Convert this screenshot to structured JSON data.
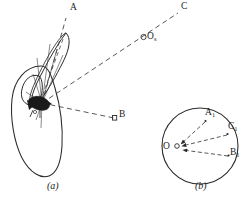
{
  "figure": {
    "background_color": "#ffffff",
    "stroke_color": "#2b2b2b",
    "fill_dark_color": "#1a1a1a",
    "panels": [
      {
        "id": "a",
        "label": "(a)",
        "description": "teardrop outline with elongated leaf ellipse and dashed rays converging at dark cluster",
        "label_x": 47,
        "label_y": 186
      },
      {
        "id": "b",
        "label": "(b)",
        "description": "circle with center O and inward arrows from boundary points",
        "label_x": 195,
        "label_y": 186
      }
    ]
  },
  "panel_a": {
    "points": [
      {
        "name": "A",
        "text": "A",
        "sub": "",
        "x": 70,
        "y": 7
      },
      {
        "name": "B",
        "text": "B",
        "sub": "",
        "x": 118,
        "y": 112
      },
      {
        "name": "C",
        "text": "C",
        "sub": "",
        "x": 181,
        "y": 3
      },
      {
        "name": "O_s",
        "text": "O",
        "sub": "s",
        "x": 141,
        "y": 31
      }
    ],
    "origin": {
      "x": 42,
      "y": 103
    },
    "ray_targets": [
      {
        "to": "A",
        "x": 66,
        "y": 18
      },
      {
        "to": "B",
        "x": 115,
        "y": 118
      },
      {
        "to": "C",
        "x": 178,
        "y": 14
      }
    ]
  },
  "panel_b": {
    "center": {
      "label": "O",
      "x": 166,
      "y": 148,
      "cx": 177,
      "cy": 146,
      "r": 2.3
    },
    "circle": {
      "cx": 200,
      "cy": 146,
      "r": 38
    },
    "points": [
      {
        "name": "A1",
        "text": "A",
        "sub": "1",
        "x": 207,
        "y": 112,
        "px": 206,
        "py": 121
      },
      {
        "name": "C1",
        "text": "C",
        "sub": "1",
        "x": 229,
        "y": 126,
        "px": 228,
        "py": 134
      },
      {
        "name": "B1",
        "text": "B",
        "sub": "1",
        "x": 230,
        "y": 151,
        "px": 229,
        "py": 155
      }
    ]
  }
}
